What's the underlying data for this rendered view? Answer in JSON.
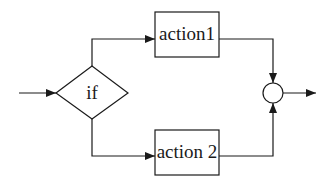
{
  "diagram": {
    "type": "flowchart",
    "nodes": {
      "condition": {
        "label": "if",
        "shape": "diamond"
      },
      "action1": {
        "label": "action1",
        "shape": "rectangle"
      },
      "action2": {
        "label": "action 2",
        "shape": "rectangle"
      },
      "merge": {
        "label": "",
        "shape": "circle"
      }
    },
    "edges": [
      {
        "from": "input",
        "to": "condition"
      },
      {
        "from": "condition",
        "to": "action1"
      },
      {
        "from": "condition",
        "to": "action2"
      },
      {
        "from": "action1",
        "to": "merge"
      },
      {
        "from": "action2",
        "to": "merge"
      },
      {
        "from": "merge",
        "to": "output"
      }
    ],
    "colors": {
      "stroke": "#1a1a1a",
      "background": "#ffffff"
    }
  }
}
